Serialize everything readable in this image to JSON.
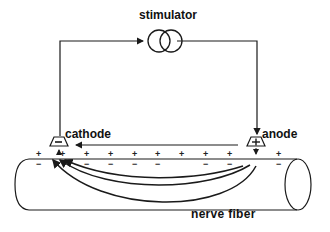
{
  "labels": {
    "stimulator": "stimulator",
    "cathode": "cathode",
    "anode": "anode",
    "nerve_fiber": "nerve fiber"
  },
  "electrodes": {
    "cathode_sign": "−",
    "anode_sign": "+"
  },
  "membrane_charges": {
    "plus": [
      {
        "x": 39,
        "s": "+"
      },
      {
        "x": 63,
        "s": "+"
      },
      {
        "x": 87,
        "s": "+"
      },
      {
        "x": 111,
        "s": "+"
      },
      {
        "x": 135,
        "s": "+"
      },
      {
        "x": 158,
        "s": "+"
      },
      {
        "x": 182,
        "s": "+"
      },
      {
        "x": 206,
        "s": "+"
      },
      {
        "x": 230,
        "s": "+"
      },
      {
        "x": 279,
        "s": "+"
      }
    ],
    "minus": [
      {
        "x": 39,
        "s": "−"
      },
      {
        "x": 87,
        "s": "−"
      },
      {
        "x": 111,
        "s": "−"
      },
      {
        "x": 135,
        "s": "−"
      },
      {
        "x": 158,
        "s": "−"
      },
      {
        "x": 206,
        "s": "−"
      },
      {
        "x": 230,
        "s": "−"
      },
      {
        "x": 279,
        "s": "−"
      }
    ]
  },
  "colors": {
    "line": "#1a1a1a",
    "background": "#ffffff"
  }
}
